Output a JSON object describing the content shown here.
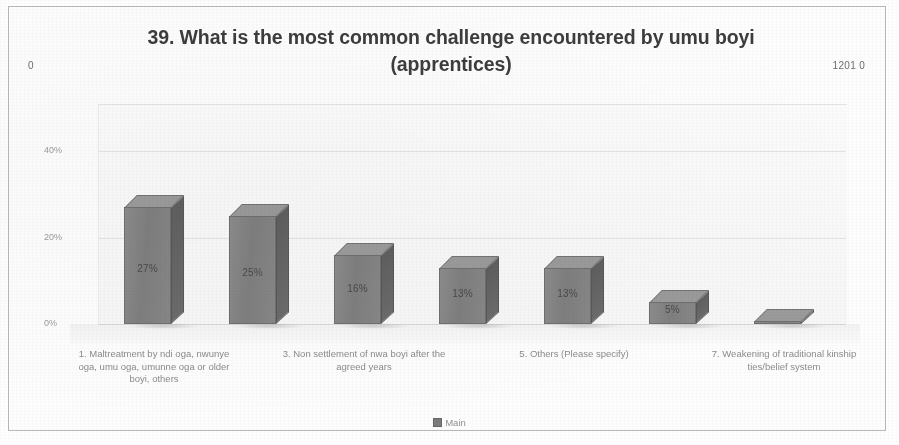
{
  "page": {
    "corner_left": "0",
    "corner_right": "1201 0"
  },
  "chart": {
    "title": "39. What is the most common challenge encountered by umu boyi (apprentices)",
    "legend_label": "Main"
  },
  "chart_data": {
    "type": "bar",
    "title": "39. What is the most common challenge encountered by umu boyi (apprentices)",
    "xlabel": "",
    "ylabel": "",
    "ylim": [
      0,
      50
    ],
    "yticks": [
      "0%",
      "20%",
      "40%"
    ],
    "ytick_values": [
      0,
      20,
      40
    ],
    "grid": true,
    "legend_position": "bottom",
    "three_d": true,
    "series": [
      {
        "name": "Main",
        "values": [
          27,
          25,
          16,
          13,
          13,
          5,
          0
        ],
        "labels": [
          "27%",
          "25%",
          "16%",
          "13%",
          "13%",
          "5%",
          ""
        ]
      }
    ],
    "categories": [
      "1. Maltreatment by ndi oga, nwunye oga, umu oga, umunne oga or older boyi, others",
      "2.",
      "3. Non settlement of nwa boyi after the agreed years",
      "4.",
      "5. Others (Please specify)",
      "6.",
      "7. Weakening of traditional kinship ties/belief system"
    ],
    "visible_category_labels": [
      {
        "index": 0,
        "text": "1. Maltreatment by ndi oga, nwunye oga, umu oga, umunne oga or older boyi, others"
      },
      {
        "index": 2,
        "text": "3. Non settlement of nwa boyi after the agreed years"
      },
      {
        "index": 4,
        "text": "5. Others (Please specify)"
      },
      {
        "index": 6,
        "text": "7. Weakening of traditional kinship ties/belief system"
      }
    ]
  },
  "colors": {
    "bar_front": "#7e7e7e",
    "bar_side": "#5f5f5f",
    "bar_top": "#9a9a9a",
    "title_text": "#3d3d3d",
    "axis_text": "#9a9a9a",
    "gridline": "#e3e3e3",
    "frame": "#b9b9b9",
    "background": "#fdfdfd"
  }
}
